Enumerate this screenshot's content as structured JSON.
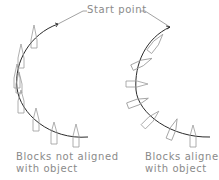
{
  "title_label": "Start point",
  "left_caption": {
    "line1": "Blocks not aligned",
    "line2": "with object"
  },
  "right_caption": {
    "line1": "Blocks aligned",
    "line2": "with object"
  },
  "colors": {
    "path": "#2a2a2a",
    "block": "#9a9a9a",
    "text": "#8a8a8a",
    "leader": "#8a8a8a"
  }
}
